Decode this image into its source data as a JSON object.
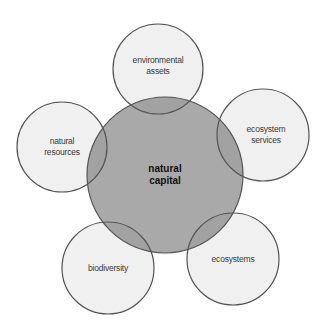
{
  "diagram": {
    "colors": {
      "outer_fill": "#f0f0f0",
      "center_fill": "#a9a9a9",
      "stroke": "#555555",
      "background": "#ffffff"
    },
    "center": {
      "label": "natural\ncapital",
      "cx": 165,
      "cy": 175,
      "r": 78
    },
    "nodes": [
      {
        "id": "environmental-assets",
        "label": "environmental\nassets",
        "cx": 158,
        "cy": 69,
        "r": 45
      },
      {
        "id": "ecosystem-services",
        "label": "ecosystem\nservices",
        "cx": 263,
        "cy": 135,
        "r": 46
      },
      {
        "id": "ecosystems",
        "label": "ecosystems",
        "cx": 233,
        "cy": 259,
        "r": 46
      },
      {
        "id": "biodiversity",
        "label": "biodiversity",
        "cx": 108,
        "cy": 268,
        "r": 46
      },
      {
        "id": "natural-resources",
        "label": "natural\nresources",
        "cx": 62,
        "cy": 147,
        "r": 45
      }
    ]
  }
}
